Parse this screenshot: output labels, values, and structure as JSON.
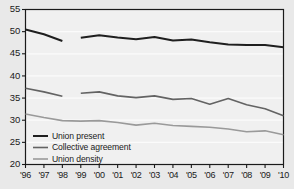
{
  "chart_data": {
    "type": "line",
    "title": "",
    "xlabel": "",
    "ylabel": "",
    "ylim": [
      20,
      55
    ],
    "ytick_step": 5,
    "yticks": [
      "20",
      "25",
      "30",
      "35",
      "40",
      "45",
      "50",
      "55"
    ],
    "grid": true,
    "grid_orientation": "horizontal",
    "legend_position": "bottom-left",
    "categories": [
      "'96",
      "'97",
      "'98",
      "'99",
      "'00",
      "'01",
      "'02",
      "'03",
      "'04",
      "'05",
      "'06",
      "'07",
      "'08",
      "'09",
      "'10"
    ],
    "x": [
      1996,
      1997,
      1998,
      1999,
      2000,
      2001,
      2002,
      2003,
      2004,
      2005,
      2006,
      2007,
      2008,
      2009,
      2010
    ],
    "note": "Series break between 1998 and 1999 - lines are drawn as two separate segments",
    "series": [
      {
        "name": "Union present",
        "color": "#1f1f1f",
        "width": 2.0,
        "values": [
          50.5,
          49.4,
          47.9,
          null,
          48.6,
          49.2,
          48.7,
          48.3,
          48.8,
          48.0,
          48.2,
          47.6,
          47.1,
          47.0,
          46.5
        ],
        "segments": [
          {
            "years": [
              1996,
              1997,
              1998
            ],
            "values": [
              50.5,
              49.4,
              47.9
            ]
          },
          {
            "years": [
              1999,
              2000,
              2001,
              2002,
              2003,
              2004,
              2005,
              2006,
              2007,
              2008,
              2009,
              2010
            ],
            "values": [
              48.6,
              49.2,
              48.7,
              48.3,
              48.8,
              48.0,
              48.2,
              47.6,
              47.1,
              47.0,
              47.0,
              46.5
            ]
          }
        ]
      },
      {
        "name": "Collective agreement",
        "color": "#636363",
        "width": 1.6,
        "values": [
          37.2,
          36.4,
          35.4,
          null,
          36.1,
          36.4,
          35.5,
          35.1,
          35.5,
          34.7,
          34.9,
          33.6,
          34.9,
          33.5,
          32.6
        ],
        "segments": [
          {
            "years": [
              1996,
              1997,
              1998
            ],
            "values": [
              37.2,
              36.4,
              35.4
            ]
          },
          {
            "years": [
              1999,
              2000,
              2001,
              2002,
              2003,
              2004,
              2005,
              2006,
              2007,
              2008,
              2009,
              2010
            ],
            "values": [
              36.1,
              36.4,
              35.5,
              35.1,
              35.5,
              34.7,
              34.9,
              33.6,
              34.9,
              33.5,
              32.6,
              31.0
            ]
          }
        ]
      },
      {
        "name": "Union density",
        "color": "#9a9a9a",
        "width": 1.6,
        "values": [
          31.4,
          30.6,
          29.9,
          29.8,
          29.9,
          29.5,
          28.9,
          29.3,
          28.8,
          28.6,
          28.4,
          28.0,
          27.4,
          27.6,
          26.7
        ],
        "segments": [
          {
            "years": [
              1996,
              1997,
              1998,
              1999,
              2000,
              2001,
              2002,
              2003,
              2004,
              2005,
              2006,
              2007,
              2008,
              2009,
              2010
            ],
            "values": [
              31.4,
              30.6,
              29.9,
              29.8,
              29.9,
              29.5,
              28.9,
              29.3,
              28.8,
              28.6,
              28.4,
              28.0,
              27.4,
              27.6,
              26.7
            ]
          }
        ]
      }
    ]
  },
  "legend": {
    "items": [
      {
        "label": "Union present"
      },
      {
        "label": "Collective agreement"
      },
      {
        "label": "Union density"
      }
    ]
  },
  "colors": {
    "page_background": "#e9e9e9",
    "plot_background": "#f0f0f0",
    "gridline": "#fbfbfb",
    "axis": "#1a1a1a",
    "series_union_present": "#1f1f1f",
    "series_collective_agreement": "#636363",
    "series_union_density": "#9a9a9a"
  }
}
